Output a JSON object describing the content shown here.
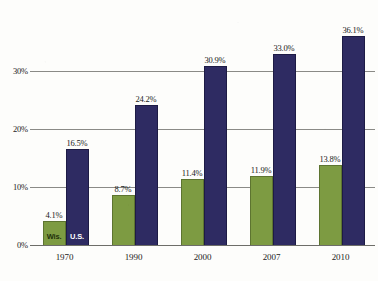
{
  "chart_data": {
    "type": "bar",
    "title": "",
    "subtitle": "",
    "xlabel": "",
    "ylabel": "",
    "categories": [
      "1970",
      "1990",
      "2000",
      "2007",
      "2010"
    ],
    "series": [
      {
        "name": "Wis.",
        "color": "#7d9b42",
        "values": [
          4.1,
          8.7,
          11.4,
          11.9,
          13.8
        ],
        "labels": [
          "4.1%",
          "8.7%",
          "11.4%",
          "11.9%",
          "13.8%"
        ]
      },
      {
        "name": "U.S.",
        "color": "#2e2b62",
        "values": [
          16.5,
          24.2,
          30.9,
          33.0,
          36.1
        ],
        "labels": [
          "16.5%",
          "24.2%",
          "30.9%",
          "33.0%",
          "36.1%"
        ]
      }
    ],
    "ylim": [
      0,
      40.5
    ],
    "yticks": [
      0,
      10,
      20,
      30
    ],
    "ytick_labels": [
      "0%",
      "10%",
      "20%",
      "30%"
    ],
    "grid": true,
    "legend_position": "in-bars-first-group",
    "legend": [
      "Wis.",
      "U.S."
    ]
  },
  "axis": {
    "y": {
      "ticks": [
        {
          "value": 0,
          "label": "0%"
        },
        {
          "value": 10,
          "label": "10%"
        },
        {
          "value": 20,
          "label": "20%"
        },
        {
          "value": 30,
          "label": "30%"
        }
      ]
    },
    "x": {
      "ticks": [
        {
          "label": "1970"
        },
        {
          "label": "1990"
        },
        {
          "label": "2000"
        },
        {
          "label": "2007"
        },
        {
          "label": "2010"
        }
      ]
    }
  },
  "colors": {
    "wis": "#7d9b42",
    "wis_border": "#5d7430",
    "us": "#2e2b62",
    "us_border": "#1d1b45",
    "gridline": "#8a8a86",
    "background": "#fdfdfb",
    "text": "#1a1a1a"
  }
}
